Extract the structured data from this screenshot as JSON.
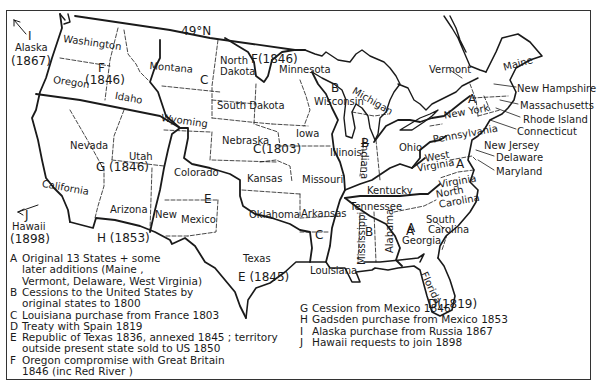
{
  "map": {
    "parallel_label": "49°N",
    "states": [
      {
        "name": "Washington",
        "x": 64,
        "y": 33,
        "rot": 8
      },
      {
        "name": "Oregon",
        "x": 54,
        "y": 74,
        "rot": 8
      },
      {
        "name": "Idaho",
        "x": 116,
        "y": 90,
        "rot": 10
      },
      {
        "name": "Montana",
        "x": 150,
        "y": 60,
        "rot": 5
      },
      {
        "name": "Wyoming",
        "x": 162,
        "y": 112,
        "rot": 8
      },
      {
        "name": "North",
        "x": 220,
        "y": 55,
        "rot": 0
      },
      {
        "name": "Dakota",
        "x": 220,
        "y": 66,
        "rot": 0
      },
      {
        "name": "South Dakota",
        "x": 217,
        "y": 100,
        "rot": 0
      },
      {
        "name": "Minnesota",
        "x": 279,
        "y": 64,
        "rot": 0
      },
      {
        "name": "Wisconsin",
        "x": 314,
        "y": 96,
        "rot": 0
      },
      {
        "name": "Michigan",
        "x": 356,
        "y": 85,
        "rot": 30
      },
      {
        "name": "Vermont",
        "x": 429,
        "y": 64,
        "rot": 0
      },
      {
        "name": "Maine",
        "x": 502,
        "y": 62,
        "rot": -15
      },
      {
        "name": "New Hampshire",
        "x": 517,
        "y": 83,
        "rot": 0
      },
      {
        "name": "Massachusetts",
        "x": 520,
        "y": 100,
        "rot": 0
      },
      {
        "name": "Rhode Island",
        "x": 523,
        "y": 114,
        "rot": 0
      },
      {
        "name": "Connecticut",
        "x": 517,
        "y": 126,
        "rot": 0
      },
      {
        "name": "New York",
        "x": 443,
        "y": 110,
        "rot": -10
      },
      {
        "name": "Pennsylvania",
        "x": 432,
        "y": 134,
        "rot": -10
      },
      {
        "name": "New Jersey",
        "x": 484,
        "y": 140,
        "rot": 0
      },
      {
        "name": "Delaware",
        "x": 496,
        "y": 152,
        "rot": 0
      },
      {
        "name": "Maryland",
        "x": 496,
        "y": 166,
        "rot": 0
      },
      {
        "name": "Ohio",
        "x": 399,
        "y": 142,
        "rot": 0
      },
      {
        "name": "West",
        "x": 424,
        "y": 153,
        "rot": -10
      },
      {
        "name": "Virginia",
        "x": 416,
        "y": 163,
        "rot": -10
      },
      {
        "name": "Virginia",
        "x": 438,
        "y": 179,
        "rot": -10
      },
      {
        "name": "Kentucky",
        "x": 367,
        "y": 185,
        "rot": 0
      },
      {
        "name": "Tennessee",
        "x": 350,
        "y": 201,
        "rot": 0
      },
      {
        "name": "North",
        "x": 435,
        "y": 189,
        "rot": -10
      },
      {
        "name": "Carolina",
        "x": 438,
        "y": 199,
        "rot": -10
      },
      {
        "name": "South",
        "x": 426,
        "y": 214,
        "rot": 0
      },
      {
        "name": "Carolina",
        "x": 428,
        "y": 224,
        "rot": 0
      },
      {
        "name": "Georgia",
        "x": 402,
        "y": 235,
        "rot": 0
      },
      {
        "name": "Illinois",
        "x": 330,
        "y": 147,
        "rot": 0
      },
      {
        "name": "Indiana",
        "x": 370,
        "y": 142,
        "rot": 90
      },
      {
        "name": "Iowa",
        "x": 296,
        "y": 128,
        "rot": 0
      },
      {
        "name": "Nebraska",
        "x": 222,
        "y": 135,
        "rot": 0
      },
      {
        "name": "Missouri",
        "x": 302,
        "y": 174,
        "rot": 0
      },
      {
        "name": "Kansas",
        "x": 247,
        "y": 173,
        "rot": 0
      },
      {
        "name": "Oklahoma",
        "x": 249,
        "y": 209,
        "rot": 0
      },
      {
        "name": "Arkansas",
        "x": 301,
        "y": 208,
        "rot": 0
      },
      {
        "name": "Mississippi",
        "x": 356,
        "y": 265,
        "rot": -90
      },
      {
        "name": "Alabama",
        "x": 384,
        "y": 253,
        "rot": -90
      },
      {
        "name": "Louisiana",
        "x": 310,
        "y": 265,
        "rot": 0
      },
      {
        "name": "Texas",
        "x": 243,
        "y": 253,
        "rot": 0
      },
      {
        "name": "Florida",
        "x": 429,
        "y": 270,
        "rot": 65
      },
      {
        "name": "Nevada",
        "x": 70,
        "y": 140,
        "rot": 0
      },
      {
        "name": "Utah",
        "x": 129,
        "y": 151,
        "rot": 0
      },
      {
        "name": "California",
        "x": 43,
        "y": 178,
        "rot": 10
      },
      {
        "name": "Arizona",
        "x": 110,
        "y": 204,
        "rot": 0
      },
      {
        "name": "New",
        "x": 155,
        "y": 209,
        "rot": 0
      },
      {
        "name": "Colorado",
        "x": 174,
        "y": 167,
        "rot": 0
      },
      {
        "name": "Mexico",
        "x": 181,
        "y": 214,
        "rot": 0
      },
      {
        "name": "Alaska",
        "x": 15,
        "y": 42,
        "rot": 0
      },
      {
        "name": "Hawaii",
        "x": 12,
        "y": 221,
        "rot": 0
      }
    ],
    "region_codes": [
      {
        "code": "I",
        "x": 28,
        "y": 30
      },
      {
        "code": "(1867)",
        "x": 11,
        "y": 55
      },
      {
        "code": "F",
        "x": 98,
        "y": 62
      },
      {
        "code": "(1846)",
        "x": 85,
        "y": 74
      },
      {
        "code": "C",
        "x": 200,
        "y": 74
      },
      {
        "code": "F(1846)",
        "x": 251,
        "y": 53
      },
      {
        "code": "B",
        "x": 331,
        "y": 82
      },
      {
        "code": "C(1803)",
        "x": 253,
        "y": 143
      },
      {
        "code": "G (1846)",
        "x": 96,
        "y": 161
      },
      {
        "code": "E",
        "x": 204,
        "y": 193
      },
      {
        "code": "C",
        "x": 315,
        "y": 229
      },
      {
        "code": "B",
        "x": 365,
        "y": 226
      },
      {
        "code": "A",
        "x": 468,
        "y": 93
      },
      {
        "code": "A",
        "x": 456,
        "y": 158
      },
      {
        "code": "A",
        "x": 406,
        "y": 225
      },
      {
        "code": "A",
        "x": 407,
        "y": 222
      },
      {
        "code": "B",
        "x": 361,
        "y": 137
      },
      {
        "code": "H (1853)",
        "x": 97,
        "y": 232
      },
      {
        "code": "E (1845)",
        "x": 238,
        "y": 271
      },
      {
        "code": "D(1819)",
        "x": 428,
        "y": 298
      },
      {
        "code": "J",
        "x": 25,
        "y": 209
      },
      {
        "code": "(1898)",
        "x": 10,
        "y": 233
      }
    ]
  },
  "legend": {
    "items": [
      {
        "key": "A",
        "lines": [
          "Original 13 States + some",
          "later additions (Maine ,",
          "Vermont, Delaware, West Virginia)"
        ]
      },
      {
        "key": "B",
        "lines": [
          "Cessions to the United States by",
          "original states to 1800"
        ]
      },
      {
        "key": "C",
        "lines": [
          "Louisiana purchase from France 1803"
        ]
      },
      {
        "key": "D",
        "lines": [
          "Treaty with Spain 1819"
        ]
      },
      {
        "key": "E",
        "lines": [
          "Republic of Texas 1836, annexed 1845 ; territory",
          "outside present state sold to US 1850"
        ]
      },
      {
        "key": "F",
        "lines": [
          "Oregon compromise with Great Britain",
          "1846 (inc Red River )"
        ]
      },
      {
        "key": "G",
        "lines": [
          "Cession from Mexico 1846"
        ]
      },
      {
        "key": "H",
        "lines": [
          "Gadsden purchase from Mexico 1853"
        ]
      },
      {
        "key": "I",
        "lines": [
          "Alaska purchase from Russia 1867"
        ]
      },
      {
        "key": "J",
        "lines": [
          "Hawaii requests to join 1898"
        ]
      }
    ]
  },
  "colors": {
    "ink": "#1a1a1a",
    "paper": "#ffffff"
  }
}
